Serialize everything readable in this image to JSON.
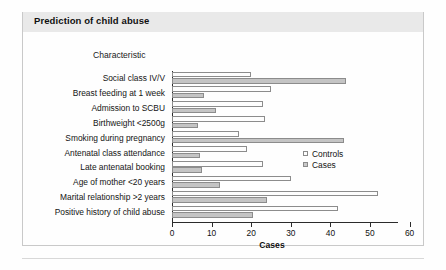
{
  "header": {
    "title": "Prediction of child abuse"
  },
  "axis_heading": "Characteristic",
  "legend": {
    "items": [
      {
        "label": "Controls",
        "swatch": "legend-swatch-controls"
      },
      {
        "label": "Cases",
        "swatch": "legend-swatch-cases"
      }
    ]
  },
  "colors": {
    "title_band": "#e9e9e9",
    "controls_fill": "#fdfdfd",
    "cases_fill": "#c4c4c4",
    "bar_outline": "#8c8c8c",
    "axis": "#2b2b2b"
  },
  "chart_data": {
    "type": "bar",
    "orientation": "horizontal",
    "title": "Prediction of child abuse",
    "xlabel": "Cases",
    "ylabel": "Characteristic",
    "xlim": [
      0,
      60
    ],
    "xticks": [
      0,
      10,
      20,
      30,
      40,
      50,
      60
    ],
    "grid": false,
    "legend_position": "middle-right",
    "categories": [
      "Social class IV/V",
      "Breast feeding at 1 week",
      "Admission to SCBU",
      "Birthweight <2500g",
      "Smoking during pregnancy",
      "Antenatal class attendance",
      "Late antenatal booking",
      "Age of mother <20 years",
      "Marital relationship >2 years",
      "Positive history of child abuse"
    ],
    "series": [
      {
        "name": "Controls",
        "values": [
          20,
          25,
          23,
          23.5,
          17,
          19,
          23,
          30,
          52,
          42
        ]
      },
      {
        "name": "Cases",
        "values": [
          44,
          8,
          11,
          6.5,
          43.5,
          7,
          7.5,
          12,
          24,
          20.5
        ]
      }
    ]
  }
}
